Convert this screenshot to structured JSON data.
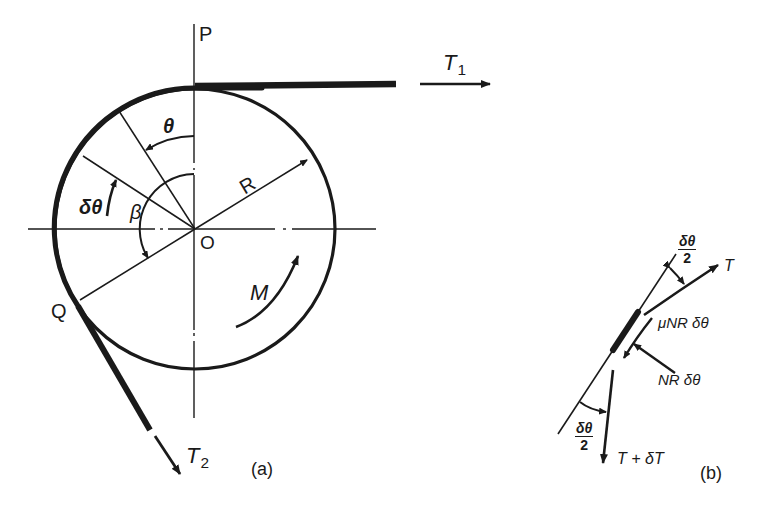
{
  "figure": {
    "panel_a": {
      "caption": "(a)",
      "labels": {
        "P": "P",
        "O": "O",
        "Q": "Q",
        "R": "R",
        "theta": "θ",
        "delta_theta": "δθ",
        "beta": "β",
        "M": "M",
        "T1_base": "T",
        "T1_sub": "1",
        "T2_base": "T",
        "T2_sub": "2"
      }
    },
    "panel_b": {
      "caption": "(b)",
      "labels": {
        "T": "T",
        "T_plus_dT": "T + δT",
        "friction_force": "μNR δθ",
        "normal_force": "NR δθ",
        "half_angle_top_num": "δθ",
        "half_angle_top_den": "2",
        "half_angle_bottom_num": "δθ",
        "half_angle_bottom_den": "2"
      }
    },
    "colors": {
      "ink": "#1a1a1a",
      "background": "#ffffff"
    }
  }
}
